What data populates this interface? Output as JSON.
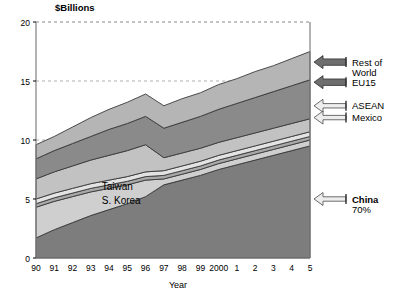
{
  "chart_data": {
    "type": "area",
    "stacked": true,
    "title": "",
    "unit_label": "$Billions",
    "xlabel": "Year",
    "ylabel": "",
    "xlim": [
      0,
      15
    ],
    "ylim": [
      0,
      20
    ],
    "yticks": [
      0,
      5,
      10,
      15,
      20
    ],
    "grid": "horizontal-dashed",
    "legend_position": "right-callouts",
    "categories": [
      "90",
      "91",
      "92",
      "93",
      "94",
      "95",
      "96",
      "97",
      "98",
      "99",
      "2000",
      "1",
      "2",
      "3",
      "4",
      "5"
    ],
    "series": [
      {
        "name": "China",
        "color": "#7d7d7d",
        "values": [
          1.7,
          2.4,
          3.0,
          3.6,
          4.1,
          4.6,
          5.2,
          6.2,
          6.6,
          7.0,
          7.5,
          7.9,
          8.3,
          8.7,
          9.1,
          9.5
        ]
      },
      {
        "name": "S. Korea",
        "color": "#cfcfcf",
        "values": [
          2.6,
          2.4,
          2.2,
          2.0,
          1.8,
          1.6,
          1.4,
          0.5,
          0.5,
          0.5,
          0.5,
          0.5,
          0.5,
          0.5,
          0.5,
          0.5
        ]
      },
      {
        "name": "Taiwan",
        "color": "#a8a8a8",
        "values": [
          0.3,
          0.3,
          0.3,
          0.3,
          0.3,
          0.3,
          0.3,
          0.3,
          0.3,
          0.3,
          0.3,
          0.3,
          0.3,
          0.3,
          0.3,
          0.3
        ]
      },
      {
        "name": "Mexico",
        "color": "#e3e3e3",
        "values": [
          0.4,
          0.4,
          0.4,
          0.4,
          0.4,
          0.4,
          0.4,
          0.4,
          0.4,
          0.4,
          0.4,
          0.4,
          0.4,
          0.4,
          0.4,
          0.4
        ]
      },
      {
        "name": "ASEAN",
        "color": "#c2c2c2",
        "values": [
          1.7,
          1.8,
          1.9,
          2.0,
          2.1,
          2.2,
          2.3,
          1.1,
          1.1,
          1.1,
          1.1,
          1.1,
          1.1,
          1.1,
          1.1,
          1.1
        ]
      },
      {
        "name": "EU15",
        "color": "#8a8a8a",
        "values": [
          1.7,
          1.8,
          1.9,
          2.0,
          2.2,
          2.3,
          2.4,
          2.5,
          2.6,
          2.7,
          2.8,
          2.9,
          3.0,
          3.1,
          3.2,
          3.3
        ]
      },
      {
        "name": "Rest of World",
        "color": "#b5b5b5",
        "values": [
          1.2,
          1.2,
          1.4,
          1.6,
          1.7,
          1.8,
          1.9,
          1.9,
          2.0,
          2.0,
          2.1,
          2.1,
          2.2,
          2.2,
          2.3,
          2.4
        ]
      }
    ],
    "totals": [
      9.6,
      10.3,
      11.1,
      11.9,
      12.6,
      13.2,
      13.9,
      12.9,
      13.5,
      14.0,
      14.7,
      15.2,
      15.8,
      16.3,
      16.9,
      17.5
    ],
    "inner_annotations": [
      {
        "text": "Taiwan",
        "x_index": 3.6,
        "value": 6.1
      },
      {
        "text": "S. Korea",
        "x_index": 3.6,
        "value": 4.9
      }
    ],
    "callouts": [
      {
        "label_line1": "Rest of",
        "label_line2": "World",
        "series": "Rest of World",
        "arrow_y_value": 16.6,
        "bold": false,
        "arrow": "filled-dark"
      },
      {
        "label_line1": "EU15",
        "label_line2": "",
        "series": "EU15",
        "arrow_y_value": 14.9,
        "bold": false,
        "arrow": "filled-dark"
      },
      {
        "label_line1": "ASEAN",
        "label_line2": "",
        "series": "ASEAN",
        "arrow_y_value": 12.9,
        "bold": false,
        "arrow": "hollow"
      },
      {
        "label_line1": "Mexico",
        "label_line2": "",
        "series": "Mexico",
        "arrow_y_value": 11.9,
        "bold": false,
        "arrow": "hollow"
      },
      {
        "label_line1": "China",
        "label_line2": "70%",
        "series": "China",
        "arrow_y_value": 5.0,
        "bold": true,
        "arrow": "hollow"
      }
    ]
  },
  "axis": {
    "y_tick_labels": [
      "0",
      "5",
      "10",
      "15",
      "20"
    ],
    "x_tick_labels": [
      "90",
      "91",
      "92",
      "93",
      "94",
      "95",
      "96",
      "97",
      "98",
      "99",
      "2000",
      "1",
      "2",
      "3",
      "4",
      "5"
    ],
    "x_axis_title": "Year",
    "y_unit_title": "$Billions"
  },
  "colors": {
    "plot_border": "#808080",
    "grid": "#b0b0b0",
    "background": "#ffffff",
    "text": "#000000",
    "band_stroke": "#3a3a3a"
  }
}
